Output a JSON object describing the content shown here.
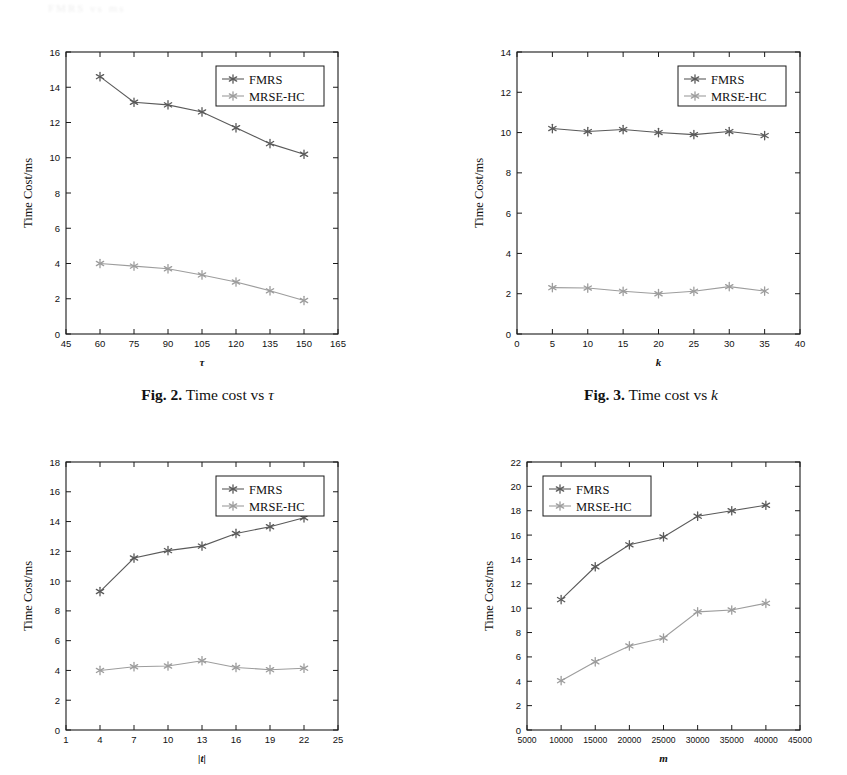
{
  "page": {
    "top_cut_text": "FMRS  vs  ms"
  },
  "figures": [
    {
      "id": "fig2",
      "caption_number": "Fig. 2.",
      "caption_text": "Time cost vs",
      "caption_symbol": "τ",
      "legend_position": "top-right",
      "chart_data": {
        "type": "line",
        "title": "",
        "xlabel": "τ",
        "ylabel": "Time Cost/ms",
        "xlim": [
          45,
          165
        ],
        "ylim": [
          0,
          16
        ],
        "xticks": [
          45,
          60,
          75,
          90,
          105,
          120,
          135,
          150,
          165
        ],
        "yticks": [
          0,
          2,
          4,
          6,
          8,
          10,
          12,
          14,
          16
        ],
        "grid": false,
        "legend": [
          "FMRS",
          "MRSE-HC"
        ],
        "x": [
          60,
          75,
          90,
          105,
          120,
          135,
          150
        ],
        "series": [
          {
            "name": "FMRS",
            "values": [
              14.6,
              13.15,
              13.0,
              12.6,
              11.7,
              10.8,
              10.2
            ],
            "color": "#5a5a5a"
          },
          {
            "name": "MRSE-HC",
            "values": [
              4.0,
              3.85,
              3.7,
              3.35,
              2.95,
              2.45,
              1.9
            ],
            "color": "#9d9d9d"
          }
        ]
      }
    },
    {
      "id": "fig3",
      "caption_number": "Fig. 3.",
      "caption_text": "Time cost vs",
      "caption_symbol": "k",
      "legend_position": "top-right",
      "chart_data": {
        "type": "line",
        "title": "",
        "xlabel": "k",
        "ylabel": "Time Cost/ms",
        "xlim": [
          0,
          40
        ],
        "ylim": [
          0,
          14
        ],
        "xticks": [
          0,
          5,
          10,
          15,
          20,
          25,
          30,
          35,
          40
        ],
        "yticks": [
          0,
          2,
          4,
          6,
          8,
          10,
          12,
          14
        ],
        "grid": false,
        "legend": [
          "FMRS",
          "MRSE-HC"
        ],
        "x": [
          5,
          10,
          15,
          20,
          25,
          30,
          35
        ],
        "series": [
          {
            "name": "FMRS",
            "values": [
              10.2,
              10.05,
              10.15,
              10.0,
              9.9,
              10.05,
              9.85
            ],
            "color": "#5a5a5a"
          },
          {
            "name": "MRSE-HC",
            "values": [
              2.3,
              2.28,
              2.12,
              2.0,
              2.12,
              2.35,
              2.13
            ],
            "color": "#9d9d9d"
          }
        ]
      }
    },
    {
      "id": "fig4",
      "caption_number": "Fig. 4.",
      "caption_text": "Time cost vs",
      "caption_symbol": "|t|",
      "legend_position": "top-right",
      "chart_data": {
        "type": "line",
        "title": "",
        "xlabel": "|t|",
        "ylabel": "Time Cost/ms",
        "xlim": [
          1,
          25
        ],
        "ylim": [
          0,
          18
        ],
        "xticks": [
          1,
          4,
          7,
          10,
          13,
          16,
          19,
          22,
          25
        ],
        "yticks": [
          0,
          2,
          4,
          6,
          8,
          10,
          12,
          14,
          16,
          18
        ],
        "grid": false,
        "legend": [
          "FMRS",
          "MRSE-HC"
        ],
        "x": [
          4,
          7,
          10,
          13,
          16,
          19,
          22
        ],
        "series": [
          {
            "name": "FMRS",
            "values": [
              9.3,
              11.55,
              12.05,
              12.35,
              13.2,
              13.65,
              14.25
            ],
            "color": "#5a5a5a"
          },
          {
            "name": "MRSE-HC",
            "values": [
              4.0,
              4.25,
              4.3,
              4.65,
              4.2,
              4.05,
              4.15
            ],
            "color": "#9d9d9d"
          }
        ]
      }
    },
    {
      "id": "fig5",
      "caption_number": "Fig. 5.",
      "caption_text": "Time cost vs",
      "caption_symbol": "m",
      "legend_position": "top-left",
      "chart_data": {
        "type": "line",
        "title": "",
        "xlabel": "m",
        "ylabel": "Time Cost/ms",
        "xlim": [
          5000,
          45000
        ],
        "ylim": [
          0,
          22
        ],
        "xticks": [
          5000,
          10000,
          15000,
          20000,
          25000,
          30000,
          35000,
          40000,
          45000
        ],
        "yticks": [
          0,
          2,
          4,
          6,
          8,
          10,
          12,
          14,
          16,
          18,
          20,
          22
        ],
        "grid": false,
        "legend": [
          "FMRS",
          "MRSE-HC"
        ],
        "x": [
          10000,
          15000,
          20000,
          25000,
          30000,
          35000,
          40000
        ],
        "series": [
          {
            "name": "FMRS",
            "values": [
              10.7,
              13.4,
              15.2,
              15.85,
              17.55,
              18.0,
              18.45
            ],
            "color": "#5a5a5a"
          },
          {
            "name": "MRSE-HC",
            "values": [
              4.05,
              5.6,
              6.9,
              7.55,
              9.7,
              9.85,
              10.4
            ],
            "color": "#9d9d9d"
          }
        ]
      }
    }
  ]
}
